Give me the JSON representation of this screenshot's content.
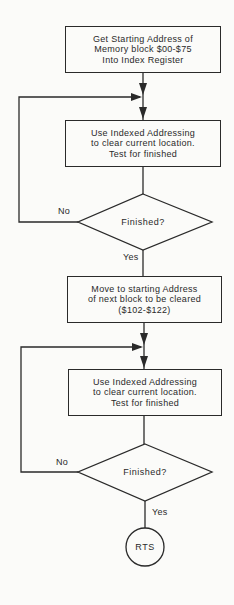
{
  "flowchart": {
    "steps": [
      {
        "id": "init",
        "type": "process",
        "text": "Get Starting Address of\nMemory block $00-$75\nInto Index Register"
      },
      {
        "id": "clear1",
        "type": "process",
        "text": "Use Indexed Addressing\nto clear current location.\nTest for finished"
      },
      {
        "id": "decision1",
        "type": "decision",
        "text": "Finished?",
        "no_label": "No",
        "yes_label": "Yes"
      },
      {
        "id": "move",
        "type": "process",
        "text": "Move to starting Address\nof next block to be cleared\n($102-$122)"
      },
      {
        "id": "clear2",
        "type": "process",
        "text": "Use Indexed Addressing\nto clear current location.\nTest for finished"
      },
      {
        "id": "decision2",
        "type": "decision",
        "text": "Finished?",
        "no_label": "No",
        "yes_label": "Yes"
      },
      {
        "id": "end",
        "type": "terminator",
        "text": "RTS"
      }
    ]
  },
  "colors": {
    "line": "#2a2a2a",
    "background": "#fbfbf9"
  }
}
